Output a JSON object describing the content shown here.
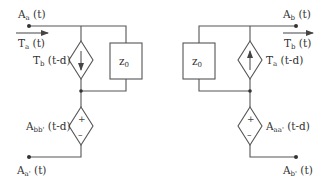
{
  "diagram": {
    "type": "circuit",
    "colors": {
      "line": "#555555",
      "text": "#333333",
      "background": "#ffffff"
    },
    "left_port": {
      "top_node": {
        "label_main": "A",
        "label_sub": "a",
        "label_tail": " (t)"
      },
      "current": {
        "label_main": "T",
        "label_sub": "a",
        "label_tail": " (t)"
      },
      "current_source": {
        "label_main": "T",
        "label_sub": "b",
        "label_tail": " (t-d)",
        "arrow": "down"
      },
      "impedance": {
        "label_main": "z",
        "label_sub": "0"
      },
      "voltage_source": {
        "label_main": "A",
        "label_sub": "bb'",
        "label_tail": " (t-d)",
        "plus": "+",
        "minus": "–"
      },
      "bottom_node": {
        "label_main": "A",
        "label_sub": "a'",
        "label_tail": " (t)"
      }
    },
    "right_port": {
      "top_node": {
        "label_main": "A",
        "label_sub": "b",
        "label_tail": " (t)"
      },
      "current": {
        "label_main": "T",
        "label_sub": "b",
        "label_tail": " (t)"
      },
      "current_source": {
        "label_main": "T",
        "label_sub": "a",
        "label_tail": " (t-d)",
        "arrow": "up"
      },
      "impedance": {
        "label_main": "z",
        "label_sub": "0"
      },
      "voltage_source": {
        "label_main": "A",
        "label_sub": "aa'",
        "label_tail": " (t-d)",
        "plus": "+",
        "minus": "–"
      },
      "bottom_node": {
        "label_main": "A",
        "label_sub": "b'",
        "label_tail": " (t)"
      }
    }
  }
}
